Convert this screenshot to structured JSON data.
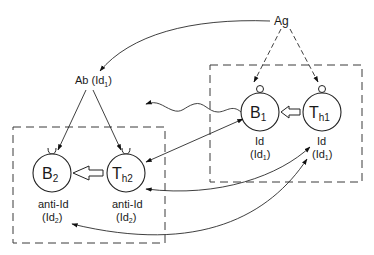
{
  "diagram": {
    "antigen": {
      "label": "Ag"
    },
    "antibody": {
      "label": "Ab (Id",
      "sub": "1",
      "close": ")"
    },
    "groups": [
      {
        "name": "idiotype-group",
        "cells": [
          {
            "id": "B1",
            "main": "B",
            "sub": "1",
            "caption1": "Id",
            "caption2_main": "(Id",
            "caption2_sub": "1",
            "caption2_close": ")"
          },
          {
            "id": "Th1",
            "main": "T",
            "sub": "h1",
            "caption1": "Id",
            "caption2_main": "(Id",
            "caption2_sub": "1",
            "caption2_close": ")"
          }
        ]
      },
      {
        "name": "anti-idiotype-group",
        "cells": [
          {
            "id": "B2",
            "main": "B",
            "sub": "2",
            "caption1": "anti-Id",
            "caption2_main": "(Id",
            "caption2_sub": "2",
            "caption2_close": ")"
          },
          {
            "id": "Th2",
            "main": "T",
            "sub": "h2",
            "caption1": "anti-Id",
            "caption2_main": "(Id",
            "caption2_sub": "2",
            "caption2_close": ")"
          }
        ]
      }
    ],
    "edges": [
      {
        "from": "Ag",
        "to": "Ab (Id1)",
        "style": "solid-curved-arrow"
      },
      {
        "from": "Ag",
        "to": "B1",
        "style": "dashed-arrow"
      },
      {
        "from": "Ag",
        "to": "Th1",
        "style": "dashed-arrow"
      },
      {
        "from": "Ab (Id1)",
        "to": "B2",
        "style": "solid-arrow"
      },
      {
        "from": "Ab (Id1)",
        "to": "Th2",
        "style": "solid-arrow"
      },
      {
        "from": "Th1",
        "to": "B1",
        "style": "hollow-block-arrow"
      },
      {
        "from": "Th2",
        "to": "B2",
        "style": "hollow-block-arrow"
      },
      {
        "from": "B1",
        "to": "left",
        "style": "wavy-arrow"
      },
      {
        "from": "B1",
        "to": "Th2",
        "style": "double-headed-arrow"
      },
      {
        "from": "Th1",
        "to": "Th2",
        "style": "double-headed-curved-arrow"
      },
      {
        "from": "Th1",
        "to": "B2",
        "style": "double-headed-curved-arrow"
      }
    ]
  }
}
